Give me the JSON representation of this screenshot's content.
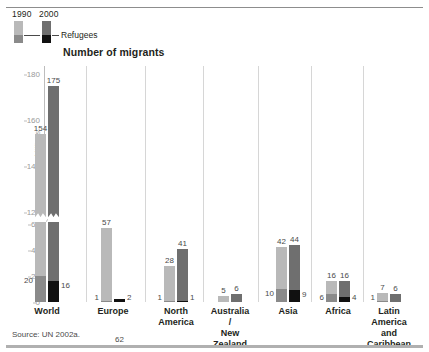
{
  "legend": {
    "series_1990_label": "1990",
    "series_2000_label": "2000",
    "refugees_label": "Refugees",
    "color_1990": "#b9b9b9",
    "color_2000": "#6f6f6f",
    "color_refugees_1990": "#8a8a8a",
    "color_refugees_2000": "#111111"
  },
  "title": "Number of migrants",
  "axis": {
    "y_label": "Millions",
    "ticks": [
      "180",
      "160",
      "140",
      "120",
      "60",
      "40",
      "20",
      "0"
    ]
  },
  "source": "Source: UN 2002a.",
  "chart_data": {
    "type": "bar",
    "title": "Number of migrants",
    "xlabel": "",
    "ylabel": "Millions",
    "ylim": [
      0,
      180
    ],
    "y_ticks": [
      0,
      20,
      40,
      60,
      120,
      140,
      160,
      180
    ],
    "axis_break": {
      "from": 60,
      "to": 120
    },
    "grid": false,
    "legend": [
      "1990",
      "2000",
      "Refugees"
    ],
    "legend_position": "top-left",
    "categories": [
      "World",
      "Europe",
      "North\nAmerica",
      "Australia /\nNew Zealand",
      "Asia",
      "Africa",
      "Latin America\nand Caribbean"
    ],
    "series": [
      {
        "name": "1990",
        "values": [
          154,
          57,
          28,
          5,
          42,
          16,
          7
        ]
      },
      {
        "name": "2000",
        "values": [
          175,
          62,
          41,
          6,
          44,
          16,
          6
        ]
      },
      {
        "name": "Refugees 1990",
        "values": [
          20,
          1,
          1,
          null,
          10,
          6,
          1
        ]
      },
      {
        "name": "Refugees 2000",
        "values": [
          16,
          2,
          1,
          null,
          9,
          4,
          null
        ]
      }
    ]
  },
  "groups": [
    {
      "name": "World",
      "label": "World",
      "bars": [
        {
          "year": "1990",
          "total": "154",
          "refugees": "20",
          "ref_side": "left"
        },
        {
          "year": "2000",
          "total": "175",
          "refugees": "16",
          "ref_side": "right"
        }
      ]
    },
    {
      "name": "Europe",
      "label": "Europe",
      "bars": [
        {
          "year": "1990",
          "total": "57",
          "refugees": "1",
          "ref_side": "left"
        },
        {
          "year": "2000",
          "total": "62",
          "refugees": "2",
          "ref_side": "right"
        }
      ]
    },
    {
      "name": "North America",
      "label": "North\nAmerica",
      "bars": [
        {
          "year": "1990",
          "total": "28",
          "refugees": "1",
          "ref_side": "left"
        },
        {
          "year": "2000",
          "total": "41",
          "refugees": "1",
          "ref_side": "right"
        }
      ]
    },
    {
      "name": "Australia / New Zealand",
      "label": "Australia /\nNew Zealand",
      "bars": [
        {
          "year": "1990",
          "total": "5",
          "refugees": "",
          "ref_side": "left"
        },
        {
          "year": "2000",
          "total": "6",
          "refugees": "",
          "ref_side": "right"
        }
      ]
    },
    {
      "name": "Asia",
      "label": "Asia",
      "bars": [
        {
          "year": "1990",
          "total": "42",
          "refugees": "10",
          "ref_side": "left"
        },
        {
          "year": "2000",
          "total": "44",
          "refugees": "9",
          "ref_side": "right"
        }
      ]
    },
    {
      "name": "Africa",
      "label": "Africa",
      "bars": [
        {
          "year": "1990",
          "total": "16",
          "refugees": "6",
          "ref_side": "left"
        },
        {
          "year": "2000",
          "total": "16",
          "refugees": "4",
          "ref_side": "right"
        }
      ]
    },
    {
      "name": "Latin America and Caribbean",
      "label": "Latin America\nand Caribbean",
      "bars": [
        {
          "year": "1990",
          "total": "7",
          "refugees": "1",
          "ref_side": "left"
        },
        {
          "year": "2000",
          "total": "6",
          "refugees": "",
          "ref_side": "right"
        }
      ]
    }
  ]
}
